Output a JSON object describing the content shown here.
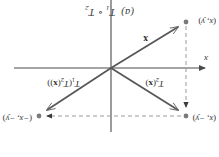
{
  "figure": {
    "caption_prefix": "(a)",
    "caption_t1": "T",
    "caption_t1_sub": "1",
    "caption_compose": "∘",
    "caption_t2": "T",
    "caption_t2_sub": "2",
    "caption_full": "(a)  T₁ ∘ T₂",
    "orientation_note": "rotated-180"
  },
  "axes": {
    "x_axis_label": "x",
    "x_axis_arrow": "left",
    "origin_px": {
      "x": 108,
      "y": 89
    },
    "x_axis_y_px": 89,
    "y_axis_x_px": 108,
    "color": "#4a4a4a"
  },
  "points": [
    {
      "id": "point-x",
      "label": "(x, y)",
      "label_x": "x",
      "label_y": "y",
      "px": {
        "x": 33,
        "y": 135
      },
      "dot_color": "#7a7a7a"
    },
    {
      "id": "point-t2x",
      "label": "(x, −y)",
      "label_x": "x",
      "label_y": "−y",
      "px": {
        "x": 33,
        "y": 41
      },
      "dot_color": "#7a7a7a"
    },
    {
      "id": "point-t1t2x",
      "label": "(−x, −y)",
      "label_x": "−x",
      "label_y": "−y",
      "px": {
        "x": 180,
        "y": 41
      },
      "dot_color": "#7a7a7a"
    }
  ],
  "vectors": [
    {
      "id": "vector-x",
      "label": "x",
      "bold": true,
      "from_px": {
        "x": 108,
        "y": 89
      },
      "to_px": {
        "x": 37,
        "y": 132
      },
      "color": "#565656"
    },
    {
      "id": "vector-t2x",
      "label": "T₂(x)",
      "label_t": "T",
      "label_sub": "2",
      "label_arg": "(x)",
      "from_px": {
        "x": 108,
        "y": 89
      },
      "to_px": {
        "x": 37,
        "y": 44
      },
      "color": "#565656"
    },
    {
      "id": "vector-t1t2x",
      "label": "T₁(T₂(x))",
      "label_t": "T",
      "label_sub": "1",
      "label_arg": "(T₂(x))",
      "from_px": {
        "x": 108,
        "y": 89
      },
      "to_px": {
        "x": 176,
        "y": 44
      },
      "color": "#565656"
    }
  ],
  "guides": [
    {
      "id": "guide-vertical-reflection",
      "style": "dashed",
      "from_px": {
        "x": 33,
        "y": 131
      },
      "to_px": {
        "x": 33,
        "y": 47
      },
      "color": "#9a9a9a",
      "arrow": "up"
    },
    {
      "id": "guide-horizontal-reflection",
      "style": "dashed",
      "from_px": {
        "x": 37,
        "y": 41
      },
      "to_px": {
        "x": 176,
        "y": 41
      },
      "color": "#9a9a9a",
      "arrow": "right"
    }
  ],
  "colors": {
    "background": "#ffffff",
    "ink": "#2e2e2e",
    "axis": "#4a4a4a",
    "vector": "#565656",
    "guide": "#9a9a9a",
    "dot": "#7a7a7a"
  }
}
